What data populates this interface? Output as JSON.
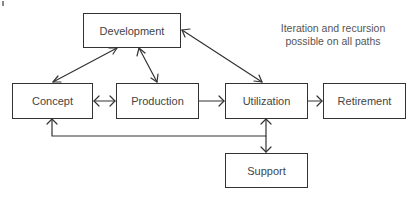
{
  "diagram": {
    "type": "lifecycle-flow",
    "nodes": [
      {
        "id": "development",
        "label": "Development",
        "x": 83,
        "y": 13,
        "w": 98,
        "h": 35
      },
      {
        "id": "concept",
        "label": "Concept",
        "x": 12,
        "y": 83,
        "w": 81,
        "h": 36
      },
      {
        "id": "production",
        "label": "Production",
        "x": 116,
        "y": 83,
        "w": 83,
        "h": 36
      },
      {
        "id": "utilization",
        "label": "Utilization",
        "x": 225,
        "y": 83,
        "w": 83,
        "h": 36
      },
      {
        "id": "retirement",
        "label": "Retirement",
        "x": 323,
        "y": 83,
        "w": 83,
        "h": 36
      },
      {
        "id": "support",
        "label": "Support",
        "x": 225,
        "y": 153,
        "w": 83,
        "h": 35
      }
    ],
    "edges": [
      {
        "from": "concept",
        "to": "development",
        "direction": "both"
      },
      {
        "from": "development",
        "to": "production",
        "direction": "both"
      },
      {
        "from": "development",
        "to": "utilization",
        "direction": "both"
      },
      {
        "from": "concept",
        "to": "production",
        "direction": "both"
      },
      {
        "from": "production",
        "to": "utilization",
        "direction": "forward"
      },
      {
        "from": "utilization",
        "to": "retirement",
        "direction": "forward"
      },
      {
        "from": "utilization",
        "to": "support",
        "direction": "both"
      },
      {
        "from": "support-line",
        "to": "concept",
        "direction": "forward"
      }
    ],
    "note": {
      "line1": "Iteration and recursion",
      "line2": "possible on all paths"
    },
    "colors": {
      "stroke": "#333333",
      "text": "#444444",
      "background": "#ffffff"
    }
  }
}
